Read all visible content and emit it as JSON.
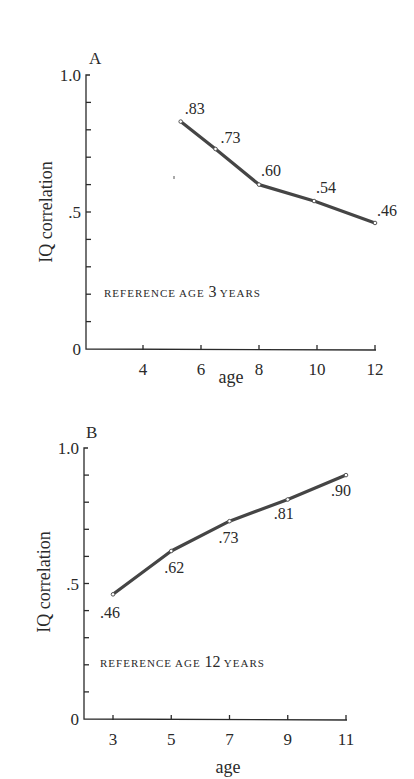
{
  "chart_data": [
    {
      "type": "line",
      "panel": "A",
      "title": "REFERENCE AGE 3 YEARS",
      "reference_label": {
        "prefix": "REFERENCE AGE",
        "number": "3",
        "suffix": "YEARS"
      },
      "xlabel": "age",
      "ylabel": "IQ correlation",
      "x_ticks": [
        4,
        6,
        8,
        10,
        12
      ],
      "y_tick_labels": [
        "0",
        ".5",
        "1.0"
      ],
      "xlim": [
        2.5,
        12
      ],
      "ylim": [
        0,
        1.0
      ],
      "y_minor_step": 0.1,
      "grid": false,
      "x": [
        5.3,
        6.5,
        8,
        9.9,
        12
      ],
      "values": [
        0.83,
        0.73,
        0.6,
        0.54,
        0.46
      ],
      "point_labels": [
        ".83",
        ".73",
        ".60",
        ".54",
        ".46"
      ]
    },
    {
      "type": "line",
      "panel": "B",
      "title": "REFERENCE AGE 12 YEARS",
      "reference_label": {
        "prefix": "REFERENCE AGE",
        "number": "12",
        "suffix": "YEARS"
      },
      "xlabel": "age",
      "ylabel": "IQ correlation",
      "x_ticks": [
        3,
        5,
        7,
        9,
        11
      ],
      "y_tick_labels": [
        "0",
        ".5",
        "1.0"
      ],
      "xlim": [
        2,
        11
      ],
      "ylim": [
        0,
        1.0
      ],
      "y_minor_step": 0.1,
      "grid": false,
      "x": [
        3,
        5,
        7,
        9,
        11
      ],
      "values": [
        0.46,
        0.62,
        0.73,
        0.81,
        0.9
      ],
      "point_labels": [
        ".46",
        ".62",
        ".73",
        ".81",
        ".90"
      ]
    }
  ],
  "colors": {
    "line": "#454545",
    "axis": "#2a2a2a",
    "background": "#ffffff"
  }
}
